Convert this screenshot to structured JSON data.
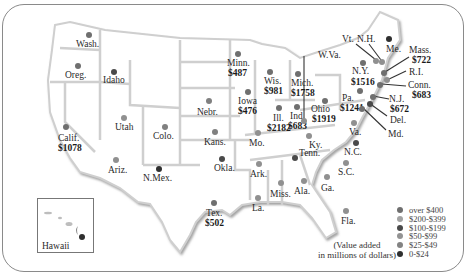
{
  "map": {
    "title": "United States value added by state",
    "note_line1": "(Value added",
    "note_line2": "in millions of dollars)",
    "inset_label": "Hawaii"
  },
  "colors": {
    "over_400": "#6f6f6f",
    "200_399": "#a0a0a0",
    "100_199": "#4a4a4a",
    "50_99": "#909090",
    "25_49": "#808080",
    "0_24": "#2f2f2f",
    "state_fill": "#ffffff",
    "border_shadow": "#c4c4c4"
  },
  "legend": [
    {
      "label": "over $400",
      "color": "#6f6f6f"
    },
    {
      "label": "$200-$399",
      "color": "#a3a3a3"
    },
    {
      "label": "$100-$199",
      "color": "#4a4a4a"
    },
    {
      "label": "$50-$99",
      "color": "#939393"
    },
    {
      "label": "$25-$49",
      "color": "#838383"
    },
    {
      "label": "0-$24",
      "color": "#2f2f2f"
    }
  ],
  "states": [
    {
      "name": "Wash.",
      "value": ""
    },
    {
      "name": "Oreg.",
      "value": ""
    },
    {
      "name": "Idaho",
      "value": ""
    },
    {
      "name": "Calif.",
      "value": "$1078"
    },
    {
      "name": "Utah",
      "value": ""
    },
    {
      "name": "Ariz.",
      "value": ""
    },
    {
      "name": "Colo.",
      "value": ""
    },
    {
      "name": "N.Mex.",
      "value": ""
    },
    {
      "name": "Nebr.",
      "value": ""
    },
    {
      "name": "Kans.",
      "value": ""
    },
    {
      "name": "Okla.",
      "value": ""
    },
    {
      "name": "Tex.",
      "value": "$502"
    },
    {
      "name": "Minn.",
      "value": "$487"
    },
    {
      "name": "Iowa",
      "value": "$476"
    },
    {
      "name": "Mo.",
      "value": ""
    },
    {
      "name": "Ark.",
      "value": ""
    },
    {
      "name": "La.",
      "value": ""
    },
    {
      "name": "Wis.",
      "value": "$981"
    },
    {
      "name": "Ill.",
      "value": "$2182"
    },
    {
      "name": "Mich.",
      "value": "$1758"
    },
    {
      "name": "Ind.",
      "value": "$683"
    },
    {
      "name": "Ohio",
      "value": "$1919"
    },
    {
      "name": "Ky.",
      "value": ""
    },
    {
      "name": "Tenn.",
      "value": ""
    },
    {
      "name": "Miss.",
      "value": ""
    },
    {
      "name": "Ala.",
      "value": ""
    },
    {
      "name": "Ga.",
      "value": ""
    },
    {
      "name": "Fla.",
      "value": ""
    },
    {
      "name": "S.C.",
      "value": ""
    },
    {
      "name": "N.C.",
      "value": ""
    },
    {
      "name": "Va.",
      "value": ""
    },
    {
      "name": "W.Va.",
      "value": ""
    },
    {
      "name": "Pa.",
      "value": "$1241"
    },
    {
      "name": "N.Y.",
      "value": "$1516"
    },
    {
      "name": "Vt.",
      "value": ""
    },
    {
      "name": "N.H.",
      "value": ""
    },
    {
      "name": "Me.",
      "value": ""
    },
    {
      "name": "Mass.",
      "value": "$722"
    },
    {
      "name": "R.I.",
      "value": ""
    },
    {
      "name": "Conn.",
      "value": "$683"
    },
    {
      "name": "N.J.",
      "value": "$672"
    },
    {
      "name": "Del.",
      "value": ""
    },
    {
      "name": "Md.",
      "value": ""
    }
  ]
}
